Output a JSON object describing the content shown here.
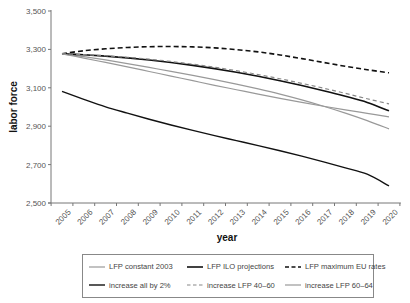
{
  "chart_data": {
    "type": "line",
    "title": "",
    "xlabel": "year",
    "ylabel": "labor force",
    "ylim": [
      2500,
      3500
    ],
    "yticks": [
      2500,
      2700,
      2900,
      3100,
      3300,
      3500
    ],
    "ytick_labels": [
      "2,500",
      "2,700",
      "2,900",
      "3,100",
      "3,300",
      "3,500"
    ],
    "grid": false,
    "legend_position": "bottom, boxed, 3 columns",
    "x": [
      "2005",
      "2006",
      "2007",
      "2008",
      "2009",
      "2010",
      "2011",
      "2012",
      "2013",
      "2014",
      "2015",
      "2016",
      "2017",
      "2018",
      "2019",
      "2020"
    ],
    "series": [
      {
        "name": "LFP constant 2003",
        "color": "#999999",
        "style": "solid",
        "width": 1.2,
        "values": [
          3277,
          3262,
          3245,
          3226,
          3206,
          3186,
          3165,
          3143,
          3119,
          3094,
          3067,
          3037,
          3004,
          2968,
          2929,
          2886
        ]
      },
      {
        "name": "LFP ILO projections",
        "color": "#111111",
        "style": "solid",
        "width": 1.6,
        "values": [
          3277,
          3272,
          3265,
          3256,
          3245,
          3232,
          3217,
          3200,
          3181,
          3160,
          3137,
          3112,
          3085,
          3056,
          3024,
          2980
        ]
      },
      {
        "name": "LFP maximum EU rates",
        "color": "#111111",
        "style": "dashed",
        "width": 1.6,
        "values": [
          3277,
          3293,
          3303,
          3310,
          3314,
          3315,
          3313,
          3308,
          3299,
          3287,
          3271,
          3252,
          3232,
          3212,
          3194,
          3178
        ]
      },
      {
        "name": "increase all by 2%",
        "color": "#111111",
        "style": "solid",
        "width": 1.4,
        "values": [
          3081,
          3040,
          3001,
          2968,
          2936,
          2906,
          2878,
          2851,
          2825,
          2799,
          2772,
          2744,
          2714,
          2683,
          2650,
          2589
        ]
      },
      {
        "name": "increase LFP 40–60",
        "color": "#888888",
        "style": "dashed",
        "width": 1.2,
        "values": [
          3277,
          3273,
          3267,
          3259,
          3249,
          3237,
          3223,
          3207,
          3189,
          3169,
          3147,
          3123,
          3098,
          3071,
          3043,
          3016
        ]
      },
      {
        "name": "increase LFP 60–64",
        "color": "#999999",
        "style": "solid",
        "width": 1.2,
        "values": [
          3277,
          3255,
          3232,
          3209,
          3185,
          3161,
          3137,
          3113,
          3090,
          3067,
          3045,
          3024,
          3004,
          2985,
          2967,
          2949
        ]
      }
    ]
  },
  "axes": {
    "ylabel": "labor force",
    "xlabel": "year"
  },
  "legend": [
    {
      "label": "LFP constant 2003"
    },
    {
      "label": "LFP ILO projections"
    },
    {
      "label": "LFP maximum EU rates"
    },
    {
      "label": "increase all by 2%"
    },
    {
      "label": "increase LFP 40–60"
    },
    {
      "label": "increase LFP 60–64"
    }
  ]
}
